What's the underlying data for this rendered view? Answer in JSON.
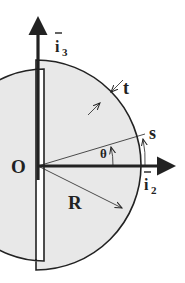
{
  "diagram": {
    "labels": {
      "origin": "O",
      "radius": "R",
      "thickness": "t",
      "arc_length": "s",
      "angle": "θ",
      "axis_vertical": "i",
      "axis_vertical_sub": "3",
      "axis_horizontal": "i",
      "axis_horizontal_sub": "2"
    },
    "colors": {
      "stroke": "#222222",
      "fill_section": "#e8e8e8",
      "background": "#ffffff"
    }
  }
}
